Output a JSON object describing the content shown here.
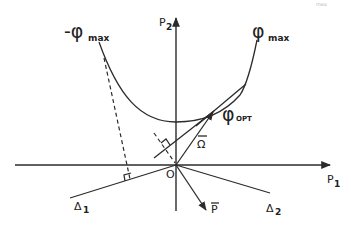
{
  "diagram": {
    "corner_fragment": "max",
    "axes": {
      "horizontal_label": "P",
      "horizontal_sub": "1",
      "vertical_label": "P",
      "vertical_sub": "2",
      "origin_label": "O"
    },
    "curve": {
      "left_label": "-φ",
      "left_sub": "max",
      "right_label": "φ",
      "right_sub": "max",
      "tangent_point_label": "φ",
      "tangent_point_sub": "OPT"
    },
    "vectors": {
      "omega_label": "Ω",
      "p_label": "P"
    },
    "lines": {
      "delta1_label": "Δ",
      "delta1_sub": "1",
      "delta2_label": "Δ",
      "delta2_sub": "2"
    }
  }
}
